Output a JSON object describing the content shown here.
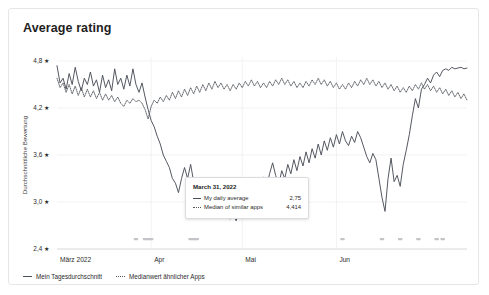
{
  "card": {
    "title": "Average rating"
  },
  "legend": {
    "items": [
      {
        "label": "Mein Tagesdurchschnitt",
        "style": "solid",
        "marker": "solid-line-icon"
      },
      {
        "label": "Medianwert ähnlicher Apps",
        "style": "dotted",
        "marker": "dotted-line-icon"
      }
    ]
  },
  "tooltip": {
    "date": "March 31, 2022",
    "rows": [
      {
        "label": "My daily average",
        "value": "2,75",
        "style": "solid"
      },
      {
        "label": "Median of similar apps",
        "value": "4,414",
        "style": "dotted"
      }
    ]
  },
  "chart_data": {
    "type": "line",
    "title": "Average rating",
    "xlabel": "",
    "ylabel": "Durchschnittliche Bewertung",
    "ylim": [
      2.4,
      4.8
    ],
    "ytick_labels": [
      "4,8 ★",
      "4,2 ★",
      "3,6 ★",
      "3,0 ★",
      "2,4 ★"
    ],
    "ytick_values": [
      4.8,
      4.2,
      3.6,
      3.0,
      2.4
    ],
    "xtick_labels": [
      "März 2022",
      "Apr",
      "Mai",
      "Jun"
    ],
    "xtick_positions": [
      0,
      31,
      61,
      92
    ],
    "grid": true,
    "legend_position": "bottom-left",
    "x_start": "2022-03-01",
    "x_end": "2022-06-18",
    "annotations": [
      {
        "date": "March 31, 2022",
        "series": "Mein Tagesdurchschnitt",
        "value": 2.75
      },
      {
        "date": "March 31, 2022",
        "series": "Medianwert ähnlicher Apps",
        "value": 4.414
      }
    ],
    "event_markers_x": [
      26,
      29,
      30,
      31,
      44,
      45,
      46,
      94,
      107,
      113,
      119,
      125,
      127
    ],
    "series": [
      {
        "name": "Mein Tagesdurchschnitt",
        "style": "solid",
        "color": "#4b4f57",
        "values": [
          4.74,
          4.52,
          4.58,
          4.44,
          4.64,
          4.5,
          4.72,
          4.54,
          4.42,
          4.58,
          4.5,
          4.66,
          4.48,
          4.56,
          4.4,
          4.62,
          4.46,
          4.56,
          4.42,
          4.7,
          4.5,
          4.58,
          4.44,
          4.62,
          4.48,
          4.7,
          4.5,
          4.4,
          4.52,
          4.34,
          4.18,
          4.04,
          3.96,
          3.84,
          3.74,
          3.6,
          3.52,
          3.44,
          3.3,
          3.24,
          3.12,
          3.3,
          3.44,
          3.3,
          3.48,
          3.26,
          3.22,
          3.14,
          3.04,
          2.96,
          2.9,
          2.86,
          2.84,
          2.82,
          2.88,
          2.8,
          2.86,
          2.78,
          2.84,
          2.76,
          2.9,
          3.04,
          3.16,
          3.04,
          3.18,
          3.1,
          3.24,
          3.16,
          3.32,
          3.2,
          3.36,
          3.5,
          3.34,
          3.22,
          3.4,
          3.3,
          3.48,
          3.36,
          3.54,
          3.4,
          3.58,
          3.46,
          3.64,
          3.5,
          3.68,
          3.56,
          3.74,
          3.6,
          3.78,
          3.66,
          3.82,
          3.7,
          3.86,
          3.74,
          3.9,
          3.78,
          3.72,
          3.84,
          3.76,
          3.9,
          3.82,
          3.7,
          3.58,
          3.5,
          3.62,
          3.54,
          3.3,
          3.06,
          2.88,
          3.3,
          3.56,
          3.26,
          3.34,
          3.2,
          3.48,
          3.66,
          3.86,
          4.1,
          4.32,
          4.2,
          4.44,
          4.5,
          4.58,
          4.52,
          4.62,
          4.66,
          4.6,
          4.68,
          4.7,
          4.68,
          4.72,
          4.7,
          4.71,
          4.72,
          4.7,
          4.71
        ]
      },
      {
        "name": "Medianwert ähnlicher Apps",
        "style": "dotted",
        "color": "#55595f",
        "values": [
          4.58,
          4.46,
          4.52,
          4.4,
          4.5,
          4.38,
          4.48,
          4.36,
          4.46,
          4.34,
          4.44,
          4.34,
          4.42,
          4.32,
          4.4,
          4.3,
          4.38,
          4.3,
          4.36,
          4.28,
          4.34,
          4.26,
          4.22,
          4.3,
          4.26,
          4.32,
          4.28,
          4.3,
          4.26,
          4.18,
          4.06,
          4.22,
          4.3,
          4.26,
          4.34,
          4.28,
          4.36,
          4.3,
          4.4,
          4.32,
          4.42,
          4.34,
          4.44,
          4.36,
          4.46,
          4.38,
          4.48,
          4.4,
          4.5,
          4.42,
          4.52,
          4.44,
          4.54,
          4.46,
          4.52,
          4.44,
          4.5,
          4.42,
          4.5,
          4.44,
          4.52,
          4.46,
          4.54,
          4.48,
          4.56,
          4.48,
          4.54,
          4.46,
          4.52,
          4.46,
          4.54,
          4.48,
          4.56,
          4.5,
          4.58,
          4.5,
          4.56,
          4.48,
          4.54,
          4.46,
          4.52,
          4.46,
          4.54,
          4.48,
          4.56,
          4.5,
          4.58,
          4.5,
          4.56,
          4.48,
          4.54,
          4.46,
          4.52,
          4.44,
          4.5,
          4.44,
          4.52,
          4.46,
          4.54,
          4.48,
          4.56,
          4.5,
          4.58,
          4.5,
          4.56,
          4.48,
          4.54,
          4.46,
          4.52,
          4.44,
          4.5,
          4.42,
          4.48,
          4.4,
          4.46,
          4.4,
          4.48,
          4.42,
          4.5,
          4.44,
          4.52,
          4.44,
          4.5,
          4.42,
          4.48,
          4.4,
          4.46,
          4.38,
          4.44,
          4.36,
          4.42,
          4.34,
          4.4,
          4.32,
          4.38,
          4.3
        ]
      }
    ]
  }
}
